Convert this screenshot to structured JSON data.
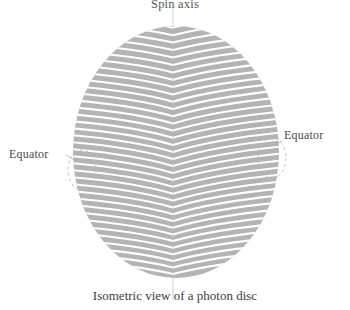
{
  "figure": {
    "title": "Spin axis",
    "caption": "Isometric view of a photon disc",
    "equator_left": "Equator",
    "equator_right": "Equator",
    "colors": {
      "disc_fill": "#b4b4b4",
      "stripe": "#ffffff",
      "axis_line": "#cfcfcf",
      "dashed_guide": "#bbbbbb",
      "text": "#3c3c3c",
      "background": "#ffffff"
    },
    "geometry": {
      "disc_center_x": 176,
      "disc_center_y": 152,
      "disc_radius_x": 103,
      "disc_radius_y": 126,
      "ridge_x": 173,
      "stripe_count": 36,
      "stripe_spacing": 7,
      "axis_top_y": 8,
      "axis_bottom_y": 298
    }
  }
}
